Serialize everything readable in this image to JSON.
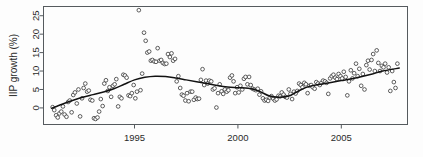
{
  "figure": {
    "background_color": "#fdfdfd",
    "frame_color": "#555a5e",
    "point_color": "#2b2b2b",
    "smooth_color": "#121212"
  },
  "chart_data": {
    "type": "scatter",
    "title": "",
    "subtitle": "",
    "xlabel": "",
    "ylabel": "IIP growth (%)",
    "xlim": [
      1990.6,
      1998.4
    ],
    "ylim": [
      -4.5,
      27.5
    ],
    "grid": false,
    "legend": null,
    "xticks": [
      1995,
      2000,
      2005
    ],
    "xtick_labels": [
      "1995",
      "2000",
      "2005"
    ],
    "yticks": [
      0,
      5,
      10,
      15,
      20,
      25
    ],
    "ytick_labels": [
      "0",
      "5",
      "10",
      "15",
      "20",
      "25"
    ],
    "x_axis_range": [
      1990.6,
      2008.2
    ],
    "y_axis_range": [
      -4.5,
      27.5
    ],
    "annotations": [],
    "series": [
      {
        "name": "IIP growth (monthly)",
        "marker": "open-circle",
        "x": [
          1991.04,
          1991.12,
          1991.21,
          1991.29,
          1991.37,
          1991.46,
          1991.54,
          1991.62,
          1991.71,
          1991.79,
          1991.87,
          1991.96,
          1992.04,
          1992.12,
          1992.21,
          1992.29,
          1992.37,
          1992.46,
          1992.54,
          1992.62,
          1992.71,
          1992.79,
          1992.87,
          1992.96,
          1993.04,
          1993.12,
          1993.21,
          1993.29,
          1993.37,
          1993.46,
          1993.54,
          1993.62,
          1993.71,
          1993.79,
          1993.87,
          1993.96,
          1994.04,
          1994.12,
          1994.21,
          1994.29,
          1994.37,
          1994.46,
          1994.54,
          1994.62,
          1994.71,
          1994.79,
          1994.87,
          1994.96,
          1995.04,
          1995.12,
          1995.21,
          1995.29,
          1995.37,
          1995.46,
          1995.54,
          1995.62,
          1995.71,
          1995.79,
          1995.87,
          1995.96,
          1996.04,
          1996.12,
          1996.21,
          1996.29,
          1996.37,
          1996.46,
          1996.54,
          1996.62,
          1996.71,
          1996.79,
          1996.87,
          1996.96,
          1997.04,
          1997.12,
          1997.21,
          1997.29,
          1997.37,
          1997.46,
          1997.54,
          1997.62,
          1997.71,
          1997.79,
          1997.87,
          1997.96,
          1998.04,
          1998.12,
          1998.21,
          1998.29,
          1998.37,
          1998.46,
          1998.54,
          1998.62,
          1998.71,
          1998.79,
          1998.87,
          1998.96,
          1999.04,
          1999.12,
          1999.21,
          1999.29,
          1999.37,
          1999.46,
          1999.54,
          1999.62,
          1999.71,
          1999.79,
          1999.87,
          1999.96,
          2000.04,
          2000.12,
          2000.21,
          2000.29,
          2000.37,
          2000.46,
          2000.54,
          2000.62,
          2000.71,
          2000.79,
          2000.87,
          2000.96,
          2001.04,
          2001.12,
          2001.21,
          2001.29,
          2001.37,
          2001.46,
          2001.54,
          2001.62,
          2001.71,
          2001.79,
          2001.87,
          2001.96,
          2002.04,
          2002.12,
          2002.21,
          2002.29,
          2002.37,
          2002.46,
          2002.54,
          2002.62,
          2002.71,
          2002.79,
          2002.87,
          2002.96,
          2003.04,
          2003.12,
          2003.21,
          2003.29,
          2003.37,
          2003.46,
          2003.54,
          2003.62,
          2003.71,
          2003.79,
          2003.87,
          2003.96,
          2004.04,
          2004.12,
          2004.21,
          2004.29,
          2004.37,
          2004.46,
          2004.54,
          2004.62,
          2004.71,
          2004.79,
          2004.87,
          2004.96,
          2005.04,
          2005.12,
          2005.21,
          2005.29,
          2005.37,
          2005.46,
          2005.54,
          2005.62,
          2005.71,
          2005.79,
          2005.87,
          2005.96,
          2006.04,
          2006.12,
          2006.21,
          2006.29,
          2006.37,
          2006.46,
          2006.54,
          2006.62,
          2006.71,
          2006.79,
          2006.87,
          2006.96,
          2007.04,
          2007.12,
          2007.21,
          2007.29,
          2007.37,
          2007.46,
          2007.54,
          2007.62,
          2007.71
        ],
        "y": [
          0.2,
          -0.6,
          -2.0,
          -2.6,
          -1.5,
          -1.0,
          0.4,
          -1.8,
          -2.4,
          1.6,
          2.0,
          -1.2,
          3.5,
          4.2,
          1.2,
          5.0,
          -2.3,
          2.6,
          5.4,
          6.6,
          4.4,
          4.7,
          2.2,
          2.0,
          -2.8,
          -3.0,
          -2.6,
          -1.0,
          2.4,
          0.5,
          6.6,
          7.5,
          4.6,
          5.6,
          3.0,
          6.0,
          6.4,
          7.8,
          0.4,
          3.0,
          2.6,
          9.0,
          8.8,
          8.2,
          3.4,
          3.2,
          4.0,
          6.2,
          2.6,
          4.4,
          26.5,
          4.8,
          9.3,
          20.4,
          18.2,
          15.0,
          15.3,
          12.8,
          13.0,
          12.6,
          12.5,
          16.2,
          12.8,
          13.0,
          12.2,
          11.9,
          12.0,
          14.6,
          13.8,
          14.8,
          12.8,
          13.3,
          7.2,
          8.6,
          5.4,
          3.6,
          3.3,
          2.0,
          4.0,
          1.8,
          4.4,
          4.4,
          2.2,
          2.8,
          2.4,
          2.5,
          7.6,
          10.5,
          6.2,
          7.4,
          6.6,
          7.4,
          7.2,
          5.0,
          5.3,
          0.1,
          4.0,
          6.4,
          4.5,
          3.8,
          5.0,
          4.4,
          4.8,
          8.2,
          8.8,
          7.2,
          4.0,
          5.6,
          4.2,
          6.0,
          5.0,
          7.9,
          8.4,
          6.4,
          8.4,
          6.2,
          5.2,
          5.0,
          4.8,
          5.2,
          3.6,
          4.5,
          2.6,
          2.0,
          2.2,
          1.9,
          2.8,
          3.2,
          2.5,
          2.0,
          2.3,
          3.3,
          3.1,
          4.2,
          3.6,
          3.0,
          2.8,
          5.0,
          3.8,
          2.4,
          4.4,
          3.9,
          4.6,
          6.6,
          6.2,
          5.6,
          6.8,
          6.4,
          4.0,
          6.0,
          6.2,
          5.6,
          5.2,
          7.0,
          6.6,
          6.2,
          6.8,
          7.4,
          7.2,
          6.8,
          3.8,
          8.0,
          8.6,
          9.0,
          8.2,
          7.8,
          9.2,
          8.6,
          8.0,
          9.8,
          8.4,
          3.4,
          7.2,
          10.2,
          8.0,
          9.4,
          12.0,
          8.6,
          10.6,
          6.0,
          9.2,
          5.0,
          11.6,
          12.8,
          10.4,
          13.0,
          14.6,
          10.0,
          15.6,
          12.2,
          10.0,
          11.4,
          11.0,
          12.0,
          9.6,
          11.0,
          4.6,
          10.0,
          7.0,
          5.4,
          12.0
        ]
      }
    ],
    "smooth": {
      "name": "loess-smooth",
      "x": [
        1991.0,
        1991.5,
        1992.0,
        1992.5,
        1993.0,
        1993.5,
        1994.0,
        1994.5,
        1995.0,
        1995.5,
        1996.0,
        1996.5,
        1997.0,
        1997.5,
        1998.0,
        1998.5,
        1999.0,
        1999.5,
        2000.0,
        2000.5,
        2001.0,
        2001.5,
        2002.0,
        2002.5,
        2003.0,
        2003.5,
        2004.0,
        2004.5,
        2005.0,
        2005.5,
        2006.0,
        2006.5,
        2007.0,
        2007.8
      ],
      "y": [
        -0.1,
        1.0,
        2.0,
        2.9,
        3.6,
        4.3,
        5.2,
        6.4,
        7.6,
        8.3,
        8.6,
        8.5,
        8.1,
        7.6,
        7.1,
        6.6,
        6.1,
        5.7,
        5.5,
        5.3,
        4.6,
        3.3,
        2.9,
        3.3,
        4.8,
        5.9,
        6.4,
        6.9,
        7.4,
        7.9,
        8.5,
        9.2,
        10.0,
        10.8
      ]
    }
  }
}
